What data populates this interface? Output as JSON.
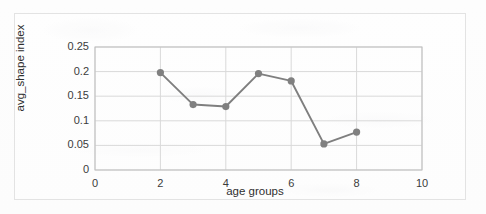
{
  "chart_data": {
    "type": "line",
    "title": "",
    "xlabel": "age groups",
    "ylabel": "avg_shape index",
    "x": [
      2,
      3,
      4,
      5,
      6,
      7,
      8
    ],
    "values": [
      0.198,
      0.133,
      0.129,
      0.196,
      0.181,
      0.053,
      0.077
    ],
    "series": [
      {
        "name": "avg_shape index",
        "x": [
          2,
          3,
          4,
          5,
          6,
          7,
          8
        ],
        "values": [
          0.198,
          0.133,
          0.129,
          0.196,
          0.181,
          0.053,
          0.077
        ]
      }
    ],
    "xlim": [
      0,
      10
    ],
    "ylim": [
      0,
      0.25
    ],
    "xticks": [
      "0",
      "2",
      "4",
      "6",
      "8",
      "10"
    ],
    "yticks": [
      "0",
      "0.05",
      "0.1",
      "0.15",
      "0.2",
      "0.25"
    ],
    "xtick_values": [
      0,
      2,
      4,
      6,
      8,
      10
    ],
    "ytick_values": [
      0,
      0.05,
      0.1,
      0.15,
      0.2,
      0.25
    ],
    "grid": "horizontal-and-vertical",
    "legend": "none",
    "marker": "circle",
    "line_color": "#7f7f7f",
    "marker_color": "#808080",
    "grid_color": "#d9d9d9",
    "plot_border_color": "#bfbfbf",
    "frame_border_color": "#e3e3e3",
    "background_color": "#fdfdfd",
    "text_color": "#3b3b3b"
  }
}
